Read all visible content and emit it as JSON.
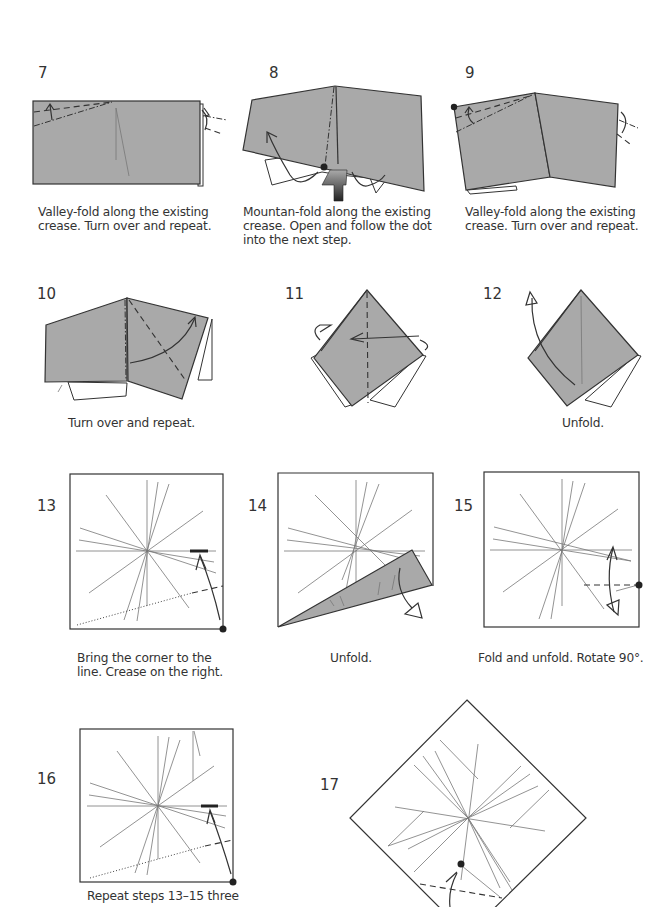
{
  "steps": [
    {
      "number": "7",
      "caption": "Valley-fold along the existing crease. Turn over and repeat."
    },
    {
      "number": "8",
      "caption": "Mountan-fold along the existing crease. Open and follow the dot into the next step."
    },
    {
      "number": "9",
      "caption": "Valley-fold along the existing crease. Turn over and repeat."
    },
    {
      "number": "10",
      "caption": "Turn over and repeat."
    },
    {
      "number": "11",
      "caption": ""
    },
    {
      "number": "12",
      "caption": "Unfold."
    },
    {
      "number": "13",
      "caption": "Bring the corner to the line. Crease on the right."
    },
    {
      "number": "14",
      "caption": "Unfold."
    },
    {
      "number": "15",
      "caption": "Fold and unfold. Rotate 90°."
    },
    {
      "number": "16",
      "caption": "Repeat steps 13–15 three"
    },
    {
      "number": "17",
      "caption": ""
    }
  ],
  "colors": {
    "paper_gray": "#a9a9a9",
    "line": "#333333",
    "crease": "#777777",
    "background": "#ffffff"
  },
  "icons": [
    "valley-fold-line",
    "mountain-fold-line",
    "fold-arrow",
    "push-arrow",
    "reference-dot",
    "turn-over-arrow",
    "unfold-arrow"
  ]
}
